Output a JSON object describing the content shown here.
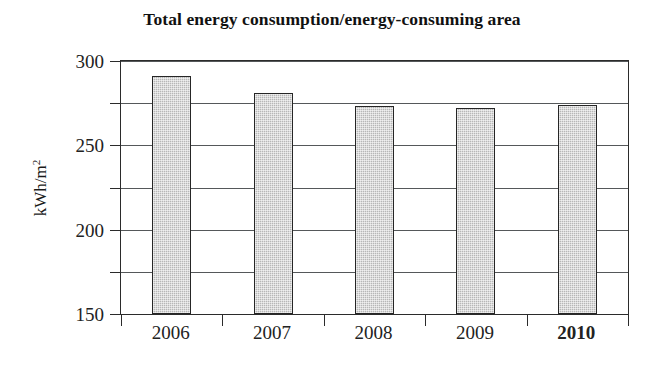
{
  "chart_data": {
    "type": "bar",
    "title": "Total energy consumption/energy-consuming area",
    "xlabel": "",
    "ylabel": "kWh/m",
    "ylabel_exponent": "2",
    "categories": [
      "2006",
      "2007",
      "2008",
      "2009",
      "2010"
    ],
    "values": [
      282,
      262,
      247,
      244,
      248
    ],
    "ylim": [
      0,
      300
    ],
    "ytick_labels": [
      "0",
      "50",
      "100",
      "150",
      "200",
      "250",
      "300"
    ],
    "ytick_values": [
      0,
      50,
      100,
      150,
      200,
      250,
      300
    ],
    "grid": "horizontal",
    "legend": "none",
    "emphasized_category": "2010",
    "bar_fill_color": "#b7b7b7",
    "bar_border_color": "#262626",
    "axis_color": "#2b2b2b",
    "gridline_color": "#55585a",
    "background_color": "#ffffff"
  }
}
